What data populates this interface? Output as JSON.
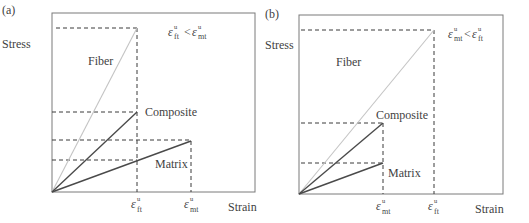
{
  "figure": {
    "panels": [
      {
        "id": "a",
        "panel_label": "(a)",
        "ylabel": "Stress",
        "xlabel": "Strain",
        "condition": {
          "left_sub": "ft",
          "sup": "u",
          "op": "<",
          "right_sub": "mt"
        },
        "curves": [
          {
            "name": "Fiber",
            "label": "Fiber"
          },
          {
            "name": "Composite",
            "label": "Composite"
          },
          {
            "name": "Matrix",
            "label": "Matrix"
          }
        ],
        "x_ticks": [
          {
            "symbol": "ε",
            "sup": "u",
            "sub": "ft"
          },
          {
            "symbol": "ε",
            "sup": "u",
            "sub": "mt"
          }
        ]
      },
      {
        "id": "b",
        "panel_label": "(b)",
        "ylabel": "Stress",
        "xlabel": "Strain",
        "condition": {
          "left_sub": "mt",
          "sup": "u",
          "op": "<",
          "right_sub": "ft"
        },
        "curves": [
          {
            "name": "Fiber",
            "label": "Fiber"
          },
          {
            "name": "Composite",
            "label": "Composite"
          },
          {
            "name": "Matrix",
            "label": "Matrix"
          }
        ],
        "x_ticks": [
          {
            "symbol": "ε",
            "sup": "u",
            "sub": "mt"
          },
          {
            "symbol": "ε",
            "sup": "u",
            "sub": "ft"
          }
        ]
      }
    ],
    "colors": {
      "fiber": "#c4c4c4",
      "composite": "#4a4a4a",
      "matrix": "#4a4a4a",
      "frame": "#7a7a7a"
    }
  }
}
